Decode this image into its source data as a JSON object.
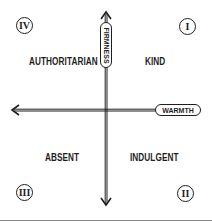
{
  "diagram": {
    "axes": {
      "vertical_label": "FIRMNESS",
      "horizontal_label": "WARMTH"
    },
    "quadrants": [
      {
        "numeral": "I",
        "label": "KIND",
        "position": "top-right"
      },
      {
        "numeral": "II",
        "label": "INDULGENT",
        "position": "bottom-right"
      },
      {
        "numeral": "III",
        "label": "ABSENT",
        "position": "bottom-left"
      },
      {
        "numeral": "IV",
        "label": "AUTHORITARIAN",
        "position": "top-left"
      }
    ],
    "colors": {
      "ink": "#1e1e1e",
      "rule": "#8a8a8a",
      "background": "#ffffff"
    }
  }
}
